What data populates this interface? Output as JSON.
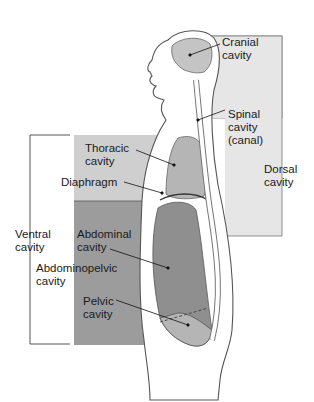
{
  "diagram": {
    "colors": {
      "dorsal_panel": "#e6e6e6",
      "thoracic_panel": "#cfcfcf",
      "abdominopelvic_panel": "#9c9c9c",
      "organ_fill": "#b5b5b5",
      "body_outline": "#555555",
      "body_fill": "#ffffff"
    },
    "labels": {
      "cranial": "Cranial\ncavity",
      "spinal": "Spinal\ncavity\n(canal)",
      "dorsal": "Dorsal\ncavity",
      "thoracic": "Thoracic\ncavity",
      "diaphragm": "Diaphragm",
      "ventral": "Ventral\ncavity",
      "abdominal": "Abdominal\ncavity",
      "abdominopelvic": "Abdominopelvic\ncavity",
      "pelvic": "Pelvic\ncavity"
    }
  }
}
